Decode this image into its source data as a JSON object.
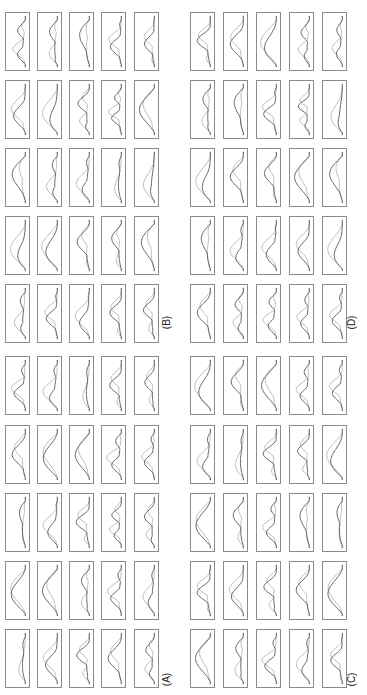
{
  "chart_data": {
    "type": "line",
    "title": "",
    "layout": "4 panels (A-D), each a 5x5 grid of small line subplots; whole figure rotated 90 degrees counter-clockwise",
    "axes": "no tick labels or axis titles visible",
    "legend": "none visible",
    "series_names": [
      "dark trace",
      "light trace"
    ],
    "colors": {
      "dark": "#4a4a4a",
      "light": "#a8a8a8",
      "border": "#8a8a8a"
    },
    "panels": [
      {
        "label": "(A)",
        "subplots": [
          [
            [
              3,
              0.8,
              0.25
            ],
            [
              2,
              0.9,
              0.3
            ],
            [
              1,
              0.9,
              0.2
            ],
            [
              3,
              0.7,
              0.4
            ],
            [
              3,
              0.6,
              0.35
            ]
          ],
          [
            [
              2,
              0.8,
              0.3
            ],
            [
              1,
              0.9,
              0.25
            ],
            [
              1,
              0.85,
              0.2
            ],
            [
              3,
              0.8,
              0.45
            ],
            [
              3,
              0.7,
              0.3
            ]
          ],
          [
            [
              1,
              0.9,
              0.2
            ],
            [
              2,
              0.8,
              0.3
            ],
            [
              3,
              0.8,
              0.4
            ],
            [
              4,
              0.7,
              0.45
            ],
            [
              3,
              0.7,
              0.35
            ]
          ],
          [
            [
              1,
              0.9,
              0.2
            ],
            [
              1,
              0.9,
              0.25
            ],
            [
              2,
              0.8,
              0.3
            ],
            [
              3,
              0.75,
              0.4
            ],
            [
              2,
              0.7,
              0.3
            ]
          ],
          [
            [
              1,
              0.9,
              0.2
            ],
            [
              2,
              0.8,
              0.3
            ],
            [
              3,
              0.8,
              0.3
            ],
            [
              2,
              0.8,
              0.3
            ],
            [
              3,
              0.7,
              0.3
            ]
          ]
        ]
      },
      {
        "label": "(B)",
        "subplots": [
          [
            [
              3,
              0.8,
              0.3
            ],
            [
              2,
              0.8,
              0.3
            ],
            [
              1,
              0.9,
              0.2
            ],
            [
              3,
              0.7,
              0.4
            ],
            [
              3,
              0.6,
              0.4
            ]
          ],
          [
            [
              2,
              0.8,
              0.3
            ],
            [
              1,
              0.9,
              0.25
            ],
            [
              3,
              0.8,
              0.4
            ],
            [
              4,
              0.7,
              0.45
            ],
            [
              1,
              0.9,
              0.2
            ]
          ],
          [
            [
              1,
              0.9,
              0.25
            ],
            [
              2,
              0.8,
              0.3
            ],
            [
              2,
              0.8,
              0.3
            ],
            [
              1,
              0.9,
              0.2
            ],
            [
              1,
              0.9,
              0.2
            ]
          ],
          [
            [
              1,
              0.9,
              0.25
            ],
            [
              1,
              0.9,
              0.2
            ],
            [
              2,
              0.8,
              0.3
            ],
            [
              2,
              0.75,
              0.3
            ],
            [
              1,
              0.9,
              0.2
            ]
          ],
          [
            [
              2,
              0.8,
              0.3
            ],
            [
              3,
              0.7,
              0.35
            ],
            [
              2,
              0.8,
              0.3
            ],
            [
              3,
              0.7,
              0.3
            ],
            [
              3,
              0.7,
              0.3
            ]
          ]
        ]
      },
      {
        "label": "(C)",
        "subplots": [
          [
            [
              1,
              0.9,
              0.2
            ],
            [
              2,
              0.8,
              0.3
            ],
            [
              1,
              0.9,
              0.2
            ],
            [
              3,
              0.75,
              0.35
            ],
            [
              3,
              0.7,
              0.4
            ]
          ],
          [
            [
              2,
              0.85,
              0.25
            ],
            [
              1,
              0.9,
              0.25
            ],
            [
              3,
              0.8,
              0.35
            ],
            [
              3,
              0.75,
              0.35
            ],
            [
              1,
              0.9,
              0.2
            ]
          ],
          [
            [
              1,
              0.9,
              0.2
            ],
            [
              2,
              0.8,
              0.3
            ],
            [
              3,
              0.8,
              0.3
            ],
            [
              1,
              0.9,
              0.2
            ],
            [
              1,
              0.9,
              0.2
            ]
          ],
          [
            [
              3,
              0.8,
              0.35
            ],
            [
              2,
              0.8,
              0.3
            ],
            [
              3,
              0.8,
              0.35
            ],
            [
              2,
              0.8,
              0.3
            ],
            [
              1,
              0.9,
              0.2
            ]
          ],
          [
            [
              1,
              0.9,
              0.2
            ],
            [
              2,
              0.8,
              0.3
            ],
            [
              3,
              0.8,
              0.3
            ],
            [
              2,
              0.8,
              0.3
            ],
            [
              3,
              0.7,
              0.3
            ]
          ]
        ]
      },
      {
        "label": "(D)",
        "subplots": [
          [
            [
              3,
              0.8,
              0.25
            ],
            [
              2,
              0.8,
              0.3
            ],
            [
              1,
              0.9,
              0.2
            ],
            [
              3,
              0.7,
              0.45
            ],
            [
              3,
              0.6,
              0.35
            ]
          ],
          [
            [
              2,
              0.8,
              0.3
            ],
            [
              1,
              0.9,
              0.25
            ],
            [
              3,
              0.8,
              0.4
            ],
            [
              4,
              0.7,
              0.45
            ],
            [
              1,
              0.9,
              0.2
            ]
          ],
          [
            [
              1,
              0.9,
              0.2
            ],
            [
              2,
              0.8,
              0.3
            ],
            [
              2,
              0.8,
              0.3
            ],
            [
              1,
              0.9,
              0.2
            ],
            [
              1,
              0.9,
              0.2
            ]
          ],
          [
            [
              1,
              0.9,
              0.25
            ],
            [
              2,
              0.8,
              0.3
            ],
            [
              2,
              0.8,
              0.3
            ],
            [
              2,
              0.75,
              0.3
            ],
            [
              1,
              0.9,
              0.2
            ]
          ],
          [
            [
              2,
              0.8,
              0.3
            ],
            [
              3,
              0.7,
              0.35
            ],
            [
              3,
              0.8,
              0.35
            ],
            [
              3,
              0.7,
              0.35
            ],
            [
              3,
              0.7,
              0.3
            ]
          ]
        ]
      }
    ],
    "subplot_encoding": "each subplot = [number_of_oscillation_peaks, dark_amplitude, light_trace_deviation]"
  },
  "labels": {
    "A": "(A)",
    "B": "(B)",
    "C": "(C)",
    "D": "(D)"
  }
}
